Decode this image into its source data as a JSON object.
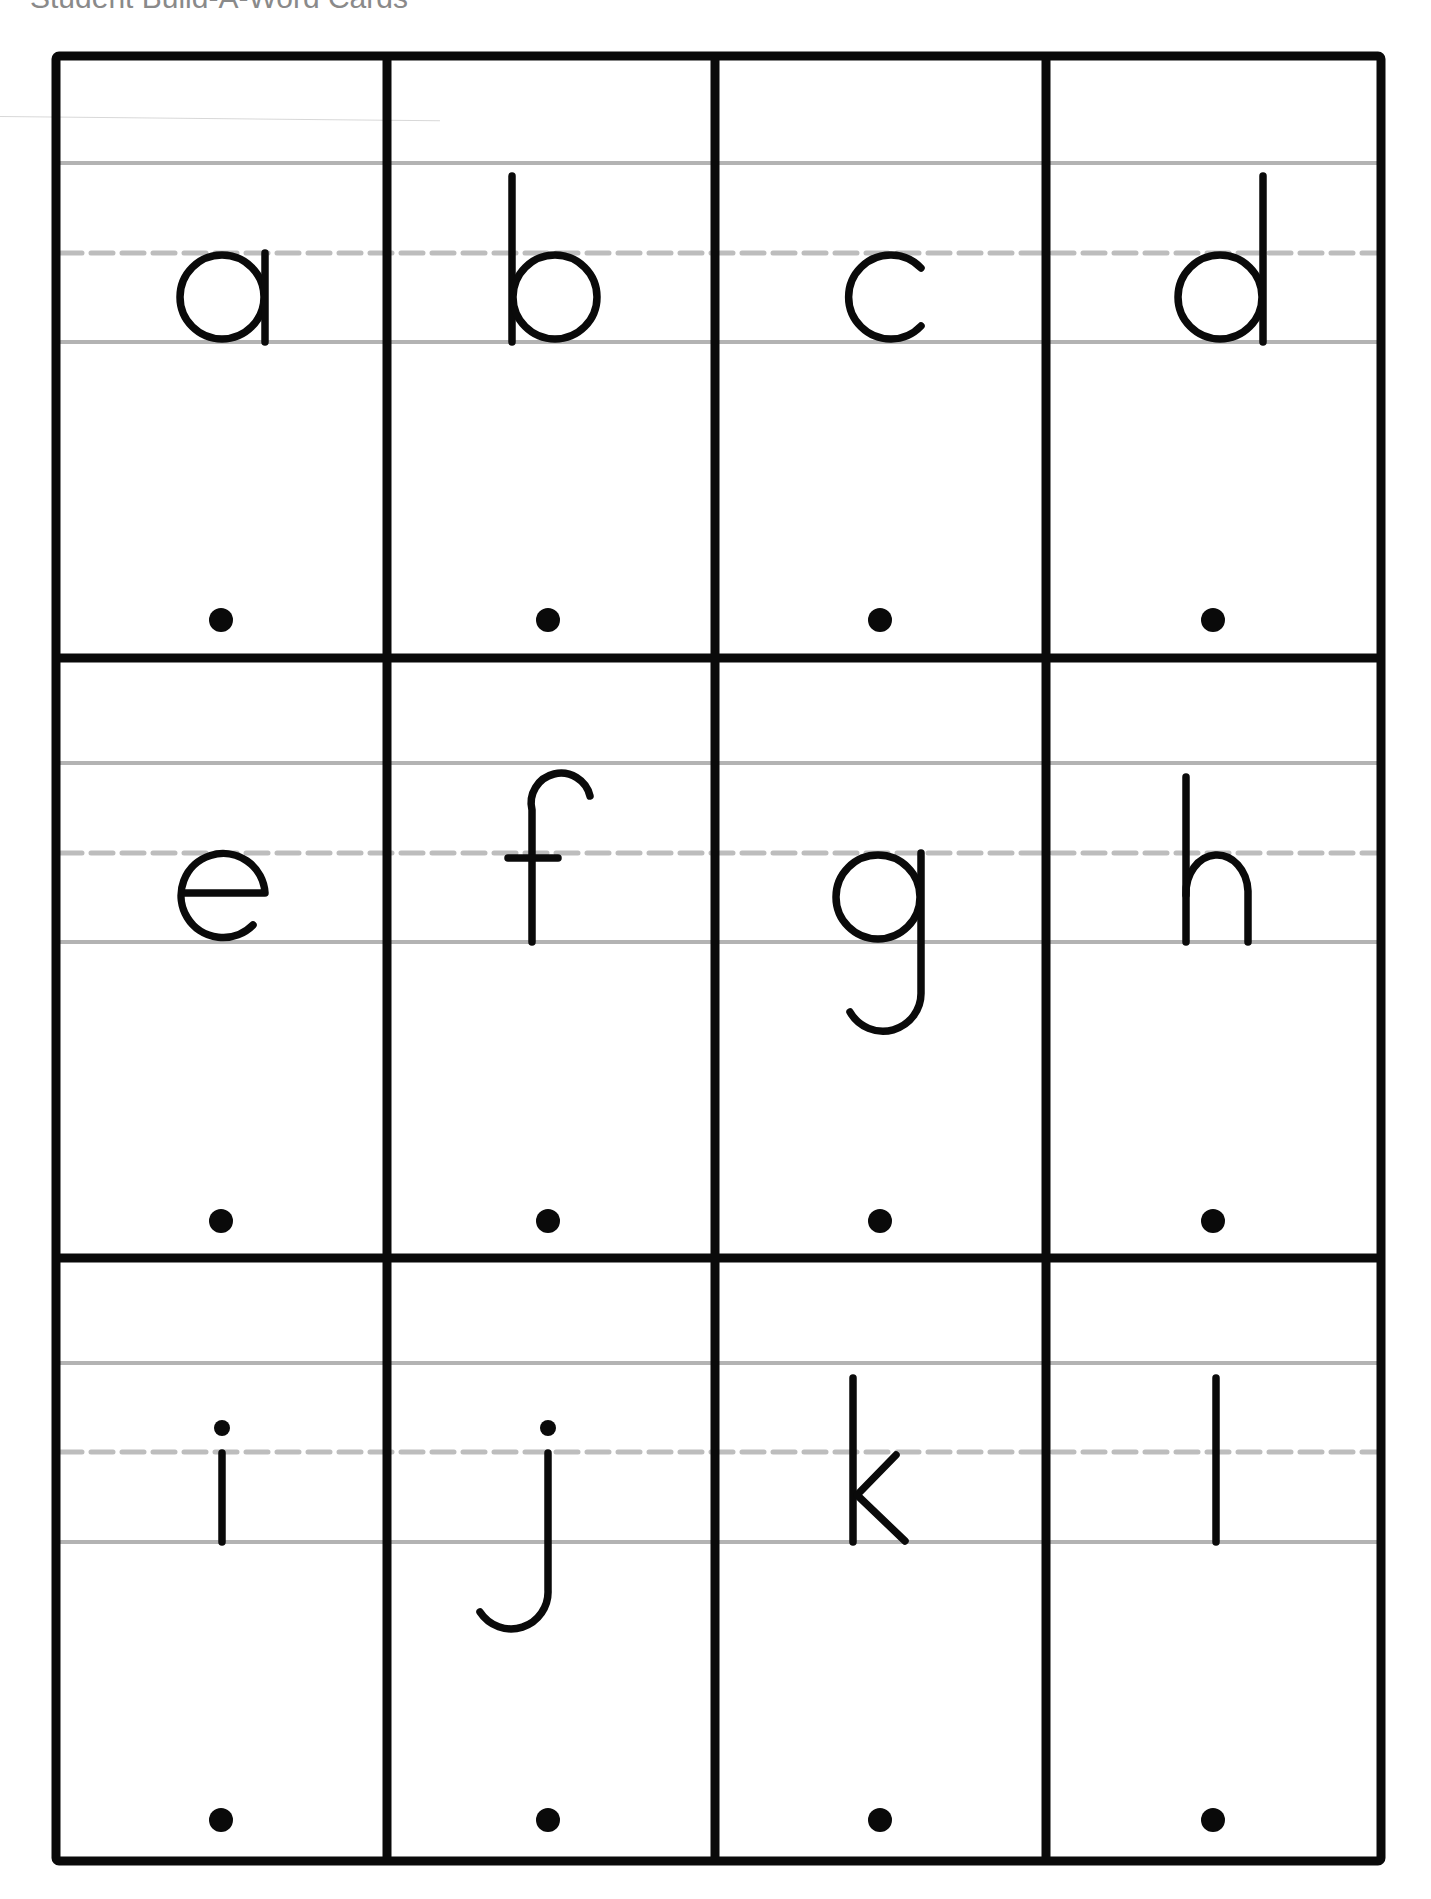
{
  "header": {
    "title": "Student Build-A-Word Cards"
  },
  "grid": {
    "rows": 3,
    "columns": 4,
    "border_color": "#0a0a0a",
    "guideline_color": "#b3b3b3"
  },
  "cards": [
    {
      "letter": "a",
      "row": 1,
      "col": 1
    },
    {
      "letter": "b",
      "row": 1,
      "col": 2
    },
    {
      "letter": "c",
      "row": 1,
      "col": 3
    },
    {
      "letter": "d",
      "row": 1,
      "col": 4
    },
    {
      "letter": "e",
      "row": 2,
      "col": 1
    },
    {
      "letter": "f",
      "row": 2,
      "col": 2
    },
    {
      "letter": "g",
      "row": 2,
      "col": 3
    },
    {
      "letter": "h",
      "row": 2,
      "col": 4
    },
    {
      "letter": "i",
      "row": 3,
      "col": 1
    },
    {
      "letter": "j",
      "row": 3,
      "col": 2
    },
    {
      "letter": "k",
      "row": 3,
      "col": 3
    },
    {
      "letter": "l",
      "row": 3,
      "col": 4
    }
  ]
}
